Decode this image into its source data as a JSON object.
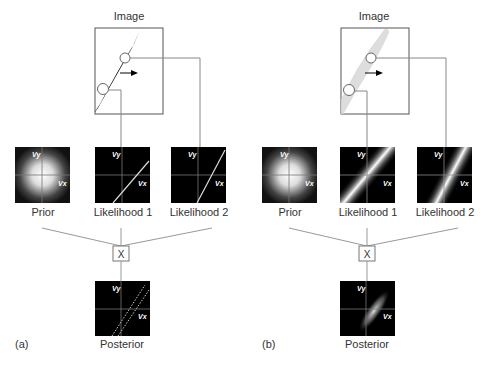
{
  "figure": {
    "panel_a": {
      "tag": "(a)",
      "image_label": "Image",
      "stimulus": "thin black tilted bar with two circular apertures and rightward motion arrow",
      "prior_label": "Prior",
      "likelihood1_label": "Likelihood 1",
      "likelihood2_label": "Likelihood 2",
      "multiply_label": "X",
      "posterior_label": "Posterior",
      "axis_vy": "Vy",
      "axis_vx": "Vx"
    },
    "panel_b": {
      "tag": "(b)",
      "image_label": "Image",
      "stimulus": "blurry low-contrast gray tilted bar with two circular apertures and rightward motion arrow",
      "prior_label": "Prior",
      "likelihood1_label": "Likelihood 1",
      "likelihood2_label": "Likelihood 2",
      "multiply_label": "X",
      "posterior_label": "Posterior",
      "axis_vy": "Vy",
      "axis_vx": "Vx"
    },
    "colors": {
      "panel_bg": "#000000",
      "line": "#888888",
      "box_border": "#555555",
      "text": "#333333"
    }
  }
}
